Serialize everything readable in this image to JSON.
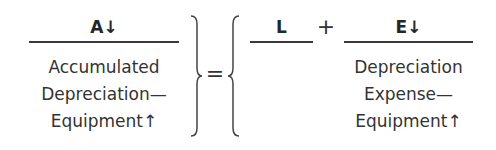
{
  "equation": {
    "left": {
      "header": "A↓",
      "lines": [
        "Accumulated",
        "Depreciation—",
        "Equipment↑"
      ]
    },
    "equals": "=",
    "right": {
      "liabilities": {
        "header": "L",
        "lines": []
      },
      "plus": "+",
      "equity": {
        "header": "E↓",
        "lines": [
          "Depreciation",
          "Expense—",
          "Equipment↑"
        ]
      }
    },
    "colors": {
      "text": "#262626",
      "rule": "#3a3a3a"
    }
  }
}
